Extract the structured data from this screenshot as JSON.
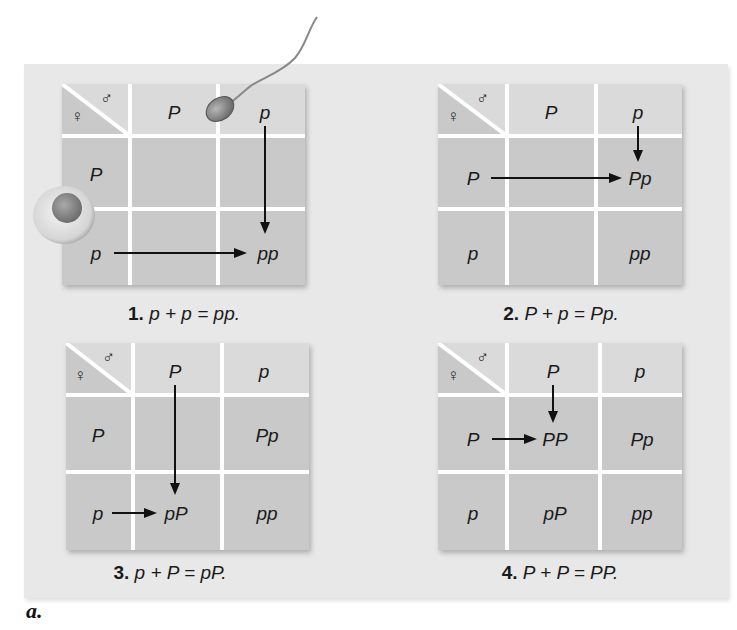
{
  "figure": {
    "label": "a.",
    "symbols": {
      "male": "♂",
      "female": "♀"
    },
    "colors": {
      "panel_background": "#e8e8e8",
      "header_cells": "#dadada",
      "body_cells": "#c9c9c9",
      "grid_lines": "#ffffff",
      "text": "#1a1a1a"
    },
    "panels": [
      {
        "number": "1.",
        "equation": "p + p = pp.",
        "male_alleles": [
          "P",
          "p"
        ],
        "female_alleles": [
          "P",
          "p"
        ],
        "cells": [
          [
            "",
            ""
          ],
          [
            "",
            "pp"
          ]
        ],
        "highlight": {
          "male": "p",
          "female": "p",
          "result": "pp"
        }
      },
      {
        "number": "2.",
        "equation": "P + p = Pp.",
        "male_alleles": [
          "P",
          "p"
        ],
        "female_alleles": [
          "P",
          "p"
        ],
        "cells": [
          [
            "",
            "Pp"
          ],
          [
            "",
            "pp"
          ]
        ],
        "highlight": {
          "male": "p",
          "female": "P",
          "result": "Pp"
        }
      },
      {
        "number": "3.",
        "equation": "p + P = pP.",
        "male_alleles": [
          "P",
          "p"
        ],
        "female_alleles": [
          "P",
          "p"
        ],
        "cells": [
          [
            "",
            "Pp"
          ],
          [
            "pP",
            "pp"
          ]
        ],
        "highlight": {
          "male": "P",
          "female": "p",
          "result": "pP"
        }
      },
      {
        "number": "4.",
        "equation": "P + P = PP.",
        "male_alleles": [
          "P",
          "p"
        ],
        "female_alleles": [
          "P",
          "p"
        ],
        "cells": [
          [
            "PP",
            "Pp"
          ],
          [
            "pP",
            "pp"
          ]
        ],
        "highlight": {
          "male": "P",
          "female": "P",
          "result": "PP"
        }
      }
    ]
  }
}
